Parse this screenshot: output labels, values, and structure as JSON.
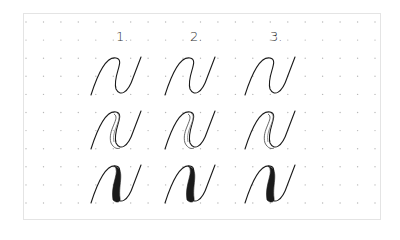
{
  "sheet": {
    "description": "Calligraphy practice sheet on dot grid",
    "background": "#ffffff",
    "border_color": "#e4e4e4",
    "dot_color": "#b8b8b8",
    "ink_color": "#1a1a1a"
  },
  "grid": {
    "x0": 26,
    "dx": 17.45,
    "cols": 21,
    "y0": 22,
    "dy": 18.1,
    "rows": 11
  },
  "columns": [
    {
      "label": "1.",
      "x": 116
    },
    {
      "label": "2.",
      "x": 190
    },
    {
      "label": "3.",
      "x": 270
    }
  ],
  "rows": [
    {
      "name": "outline-stroke",
      "y": 58
    },
    {
      "name": "double-outline-stroke",
      "y": 112
    },
    {
      "name": "filled-downstroke",
      "y": 166
    }
  ]
}
